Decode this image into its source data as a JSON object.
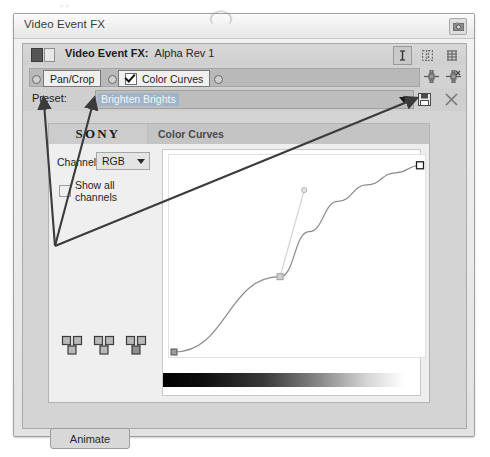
{
  "window": {
    "title": "Video Event FX",
    "corner_button_icon": "camera-icon"
  },
  "fx_header": {
    "title": "Video Event FX:",
    "subject": "Alpha Rev 1",
    "buttons": [
      {
        "name": "text-tool-button",
        "icon": "text-cursor-icon"
      },
      {
        "name": "split-view-button",
        "icon": "two-columns-icon"
      },
      {
        "name": "grid-view-button",
        "icon": "grid-icon"
      }
    ]
  },
  "plugin_chain": {
    "nodes": [
      {
        "label": "Pan/Crop",
        "checked": false
      },
      {
        "label": "Color Curves",
        "checked": true
      }
    ],
    "side_buttons": [
      {
        "name": "add-plugin-button",
        "icon": "plugin-add-icon"
      },
      {
        "name": "remove-plugin-button",
        "icon": "plugin-remove-icon"
      }
    ]
  },
  "preset": {
    "label": "Preset:",
    "value": "Brighten Brights",
    "placeholder": "Brighten Brights",
    "dropdown_icon": "chevron-down-icon",
    "save_icon": "save-icon",
    "delete_icon": "close-icon"
  },
  "plugin": {
    "brand": "SONY",
    "tab_label": "Color Curves",
    "channel": {
      "label": "Channel:",
      "value": "RGB",
      "options": [
        "RGB",
        "Red",
        "Green",
        "Blue"
      ]
    },
    "show_all_channels": {
      "label": "Show all channels",
      "checked": false
    },
    "icon_buttons": [
      {
        "name": "curve-preset-button-1",
        "icon": "nodes-icon"
      },
      {
        "name": "curve-preset-button-2",
        "icon": "nodes-icon"
      },
      {
        "name": "curve-preset-button-3",
        "icon": "nodes-icon"
      }
    ]
  },
  "chart_data": {
    "type": "line",
    "xlabel": "Input",
    "ylabel": "Output",
    "xlim": [
      0,
      255
    ],
    "ylim": [
      0,
      255
    ],
    "grid": false,
    "legend": "none",
    "series": [
      {
        "name": "RGB curve",
        "x": [
          0,
          110,
          140,
          170,
          200,
          230,
          255
        ],
        "y": [
          0,
          100,
          160,
          200,
          222,
          238,
          248
        ]
      }
    ],
    "control_points": [
      {
        "name": "black-point",
        "x": 0,
        "y": 0
      },
      {
        "name": "mid-point",
        "x": 110,
        "y": 100
      },
      {
        "name": "white-point",
        "x": 255,
        "y": 248
      }
    ],
    "tangent_handle": {
      "from_x": 110,
      "from_y": 100,
      "to_x": 135,
      "to_y": 215
    },
    "gradient_bar": "black-to-white"
  },
  "footer": {
    "animate_label": "Animate"
  },
  "annotations": {
    "arrows": [
      {
        "name": "arrow-to-preset-label",
        "from_x": 55,
        "from_y": 246,
        "to_x": 44,
        "to_y": 103
      },
      {
        "name": "arrow-to-preset-value",
        "from_x": 55,
        "from_y": 246,
        "to_x": 93,
        "to_y": 103
      },
      {
        "name": "arrow-to-preset-dropdown",
        "from_x": 55,
        "from_y": 246,
        "to_x": 412,
        "to_y": 100
      }
    ],
    "color": "#3b3b3b"
  }
}
